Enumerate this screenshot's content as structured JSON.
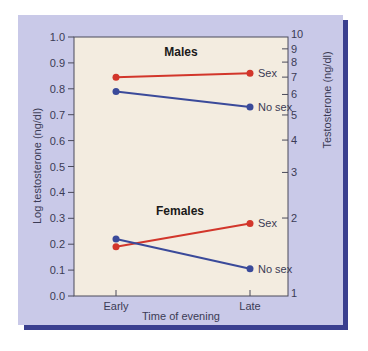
{
  "chart_data": {
    "type": "line",
    "title": "",
    "xlabel": "Time of evening",
    "ylabel": "Log testosterone (ng/dl)",
    "ylabel_right": "Testosterone (ng/dl)",
    "categories": [
      "Early",
      "Late"
    ],
    "ylim": [
      0.0,
      1.0
    ],
    "yticks": [
      "0.0",
      "0.1",
      "0.2",
      "0.3",
      "0.4",
      "0.5",
      "0.6",
      "0.7",
      "0.8",
      "0.9",
      "1.0"
    ],
    "yticks_right": [
      "1",
      "2",
      "3",
      "4",
      "5",
      "6",
      "7",
      "8",
      "9",
      "10"
    ],
    "grid": false,
    "groups": [
      {
        "name": "Males",
        "series": [
          {
            "name": "Sex",
            "color": "#d2362b",
            "values": [
              0.845,
              0.86
            ]
          },
          {
            "name": "No sex",
            "color": "#3a4a9a",
            "values": [
              0.79,
              0.73
            ]
          }
        ]
      },
      {
        "name": "Females",
        "series": [
          {
            "name": "Sex",
            "color": "#d2362b",
            "values": [
              0.19,
              0.28
            ]
          },
          {
            "name": "No sex",
            "color": "#3a4a9a",
            "values": [
              0.22,
              0.105
            ]
          }
        ]
      }
    ]
  },
  "colors": {
    "panel_bg": "#c9c9e8",
    "plot_bg": "#f3ece0",
    "shadow": "#3a3f8f",
    "sex_line": "#d2362b",
    "nosex_line": "#3a4a9a"
  },
  "labels": {
    "males": "Males",
    "females": "Females",
    "sex": "Sex",
    "no_sex": "No sex",
    "early": "Early",
    "late": "Late",
    "xlabel": "Time of evening",
    "ylabel_left": "Log testosterone (ng/dl)",
    "ylabel_right": "Testosterone (ng/dl)"
  }
}
